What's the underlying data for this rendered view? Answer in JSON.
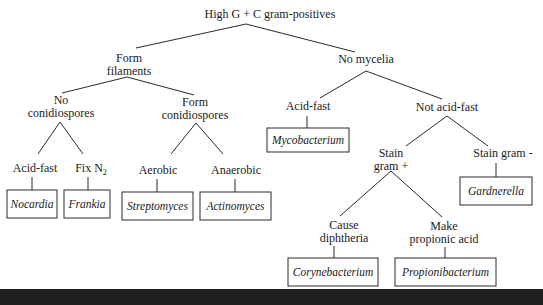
{
  "diagram": {
    "title": "High G + C gram-positives",
    "nodes": [
      {
        "id": "root",
        "lines": [
          "High G + C gram-positives"
        ],
        "x": 270,
        "y": 18
      },
      {
        "id": "filaments",
        "lines": [
          "Form",
          "filaments"
        ],
        "x": 129,
        "y": 62
      },
      {
        "id": "no_mycelia",
        "lines": [
          "No mycelia"
        ],
        "x": 366,
        "y": 63
      },
      {
        "id": "no_conidio",
        "lines": [
          "No",
          "conidiospores"
        ],
        "x": 61,
        "y": 104
      },
      {
        "id": "form_conidio",
        "lines": [
          "Form",
          "conidiospores"
        ],
        "x": 195,
        "y": 106
      },
      {
        "id": "acid_fast_r",
        "lines": [
          "Acid-fast"
        ],
        "x": 308,
        "y": 110
      },
      {
        "id": "not_acid_fast",
        "lines": [
          "Not acid-fast"
        ],
        "x": 447,
        "y": 111
      },
      {
        "id": "acid_fast_l",
        "lines": [
          "Acid-fast"
        ],
        "x": 35,
        "y": 172
      },
      {
        "id": "fix_n2",
        "lines": [
          "Fix N"
        ],
        "sub": "2",
        "x": 91,
        "y": 172
      },
      {
        "id": "aerobic",
        "lines": [
          "Aerobic"
        ],
        "x": 158,
        "y": 174
      },
      {
        "id": "anaerobic",
        "lines": [
          "Anaerobic"
        ],
        "x": 236,
        "y": 174
      },
      {
        "id": "stain_pos",
        "lines": [
          "Stain",
          "gram +"
        ],
        "x": 391,
        "y": 157
      },
      {
        "id": "stain_neg",
        "lines": [
          "Stain gram -"
        ],
        "x": 503,
        "y": 157
      },
      {
        "id": "diphtheria",
        "lines": [
          "Cause",
          "diphtheria"
        ],
        "x": 344,
        "y": 229
      },
      {
        "id": "propionic",
        "lines": [
          "Make",
          "propionic acid"
        ],
        "x": 444,
        "y": 230
      }
    ],
    "leaves": [
      {
        "id": "mycobacterium",
        "label": "Mycobacterium",
        "x": 267,
        "y": 128,
        "w": 82,
        "h": 24
      },
      {
        "id": "nocardia",
        "label": "Nocardia",
        "x": 7,
        "y": 190,
        "w": 50,
        "h": 28
      },
      {
        "id": "frankia",
        "label": "Frankia",
        "x": 64,
        "y": 190,
        "w": 46,
        "h": 28
      },
      {
        "id": "streptomyces",
        "label": "Streptomyces",
        "x": 122,
        "y": 192,
        "w": 71,
        "h": 28
      },
      {
        "id": "actinomyces",
        "label": "Actinomyces",
        "x": 200,
        "y": 192,
        "w": 71,
        "h": 28
      },
      {
        "id": "gardnerella",
        "label": "Gardnerella",
        "x": 460,
        "y": 177,
        "w": 72,
        "h": 28
      },
      {
        "id": "corynebacterium",
        "label": "Corynebacterium",
        "x": 288,
        "y": 258,
        "w": 90,
        "h": 28
      },
      {
        "id": "propionibacterium",
        "label": "Propionibacterium",
        "x": 395,
        "y": 258,
        "w": 101,
        "h": 28
      }
    ],
    "edges": [
      [
        246,
        24,
        136,
        48
      ],
      [
        246,
        24,
        355,
        52
      ],
      [
        127,
        77,
        62,
        93
      ],
      [
        127,
        77,
        194,
        95
      ],
      [
        366,
        71,
        320,
        98
      ],
      [
        366,
        71,
        442,
        99
      ],
      [
        60,
        122,
        38,
        154
      ],
      [
        60,
        122,
        83,
        154
      ],
      [
        196,
        123,
        171,
        154
      ],
      [
        196,
        123,
        223,
        154
      ],
      [
        447,
        116,
        406,
        146
      ],
      [
        447,
        116,
        488,
        146
      ],
      [
        391,
        171,
        340,
        216
      ],
      [
        391,
        171,
        442,
        217
      ],
      [
        307,
        116,
        307,
        128
      ],
      [
        32,
        177,
        32,
        190
      ],
      [
        88,
        177,
        88,
        190
      ],
      [
        157,
        179,
        157,
        192
      ],
      [
        235,
        179,
        235,
        192
      ],
      [
        496,
        163,
        496,
        177
      ],
      [
        334,
        246,
        334,
        258
      ],
      [
        445,
        247,
        445,
        258
      ]
    ]
  }
}
